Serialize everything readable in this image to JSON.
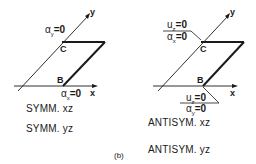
{
  "figure_label": "(b)",
  "left_panel": {
    "axes": {
      "x": "x",
      "y": "y"
    },
    "points": {
      "B": "B",
      "C": "C"
    },
    "conditions": {
      "top": "α_y=0",
      "bottom": "α_x=0"
    },
    "top_sym": "α",
    "top_sub": "y",
    "top_eq": "=0",
    "bottom_sym": "α",
    "bottom_sub": "x",
    "bottom_eq": "=0",
    "captions": [
      "SYMM. xz",
      "SYMM. yz"
    ]
  },
  "right_panel": {
    "axes": {
      "x": "x",
      "y": "y"
    },
    "points": {
      "B": "B",
      "C": "C"
    },
    "top_condition": {
      "numer_sym": "u",
      "numer_sub": "z",
      "numer_eq": "=0",
      "denom_sym": "α",
      "denom_sub": "x",
      "denom_eq": "=0"
    },
    "bottom_condition": {
      "numer_sym": "u",
      "numer_sub": "z",
      "numer_eq": "=0",
      "denom_sym": "α",
      "denom_sub": "y",
      "denom_eq": "=0"
    },
    "captions": [
      "ANTISYM. xz",
      "ANTISYM. yz"
    ]
  }
}
